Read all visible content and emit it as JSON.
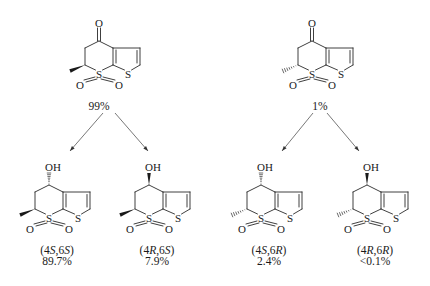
{
  "diagram": {
    "type": "stereochemical-reduction-scheme",
    "colors": {
      "ink": "#1a1a1a",
      "arrow": "#555555",
      "background": "#ffffff"
    }
  },
  "starting_materials": [
    {
      "id": "ketone-6S",
      "position": {
        "x": 99,
        "y": 41
      },
      "top_group": "O",
      "top_bond": "double",
      "ring_sulfur": "S",
      "thiophene_sulfur": "S",
      "sulfonyl_oxygens": [
        "O",
        "O"
      ],
      "methyl_stereo": "wedge",
      "fraction_label": "99%",
      "fraction_pos": {
        "x": 99,
        "y": 106
      }
    },
    {
      "id": "ketone-6R",
      "position": {
        "x": 312,
        "y": 41
      },
      "top_group": "O",
      "top_bond": "double",
      "ring_sulfur": "S",
      "thiophene_sulfur": "S",
      "sulfonyl_oxygens": [
        "O",
        "O"
      ],
      "methyl_stereo": "hash",
      "fraction_label": "1%",
      "fraction_pos": {
        "x": 320,
        "y": 106
      }
    }
  ],
  "arrows": [
    {
      "from": {
        "x": 103,
        "y": 113
      },
      "to": {
        "x": 70,
        "y": 151
      }
    },
    {
      "from": {
        "x": 115,
        "y": 113
      },
      "to": {
        "x": 148,
        "y": 151
      }
    },
    {
      "from": {
        "x": 313,
        "y": 113
      },
      "to": {
        "x": 282,
        "y": 151
      }
    },
    {
      "from": {
        "x": 327,
        "y": 113
      },
      "to": {
        "x": 359,
        "y": 151
      }
    }
  ],
  "products": [
    {
      "id": "alcohol-4S-6S",
      "position": {
        "x": 49,
        "y": 185
      },
      "top_group": "OH",
      "oh_stereo": "hash",
      "methyl_stereo": "wedge",
      "ring_sulfur": "S",
      "thiophene_sulfur": "S",
      "sulfonyl_oxygens": [
        "O",
        "O"
      ],
      "config_prefix": "(4",
      "config_c4": "S",
      "config_mid": ",6",
      "config_c6": "S",
      "config_suffix": ")",
      "percent": "89.7%"
    },
    {
      "id": "alcohol-4R-6S",
      "position": {
        "x": 149,
        "y": 185
      },
      "top_group": "OH",
      "oh_stereo": "wedge",
      "methyl_stereo": "wedge",
      "ring_sulfur": "S",
      "thiophene_sulfur": "S",
      "sulfonyl_oxygens": [
        "O",
        "O"
      ],
      "config_prefix": "(4",
      "config_c4": "R",
      "config_mid": ",6",
      "config_c6": "S",
      "config_suffix": ")",
      "percent": "7.9%"
    },
    {
      "id": "alcohol-4S-6R",
      "position": {
        "x": 261,
        "y": 185
      },
      "top_group": "OH",
      "oh_stereo": "hash",
      "methyl_stereo": "hash",
      "ring_sulfur": "S",
      "thiophene_sulfur": "S",
      "sulfonyl_oxygens": [
        "O",
        "O"
      ],
      "config_prefix": "(4",
      "config_c4": "S",
      "config_mid": ",6",
      "config_c6": "R",
      "config_suffix": ")",
      "percent": "2.4%"
    },
    {
      "id": "alcohol-4R-6R",
      "position": {
        "x": 367,
        "y": 185
      },
      "top_group": "OH",
      "oh_stereo": "wedge",
      "methyl_stereo": "hash",
      "ring_sulfur": "S",
      "thiophene_sulfur": "S",
      "sulfonyl_oxygens": [
        "O",
        "O"
      ],
      "config_prefix": "(4",
      "config_c4": "R",
      "config_mid": ",6",
      "config_c6": "R",
      "config_suffix": ")",
      "percent": "<0.1%"
    }
  ]
}
